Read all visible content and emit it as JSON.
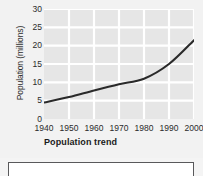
{
  "chart_data": {
    "type": "line",
    "title": "Population trend",
    "xlabel": "",
    "ylabel": "Population (millions)",
    "x": [
      1940,
      1950,
      1960,
      1970,
      1980,
      1990,
      2000
    ],
    "xtick_labels": [
      "1940",
      "1950",
      "1960",
      "1970",
      "1980",
      "1990",
      "2000"
    ],
    "ytick_labels": [
      "0",
      "5",
      "10",
      "15",
      "20",
      "25",
      "30"
    ],
    "yticks": [
      0,
      5,
      10,
      15,
      20,
      25,
      30
    ],
    "xlim": [
      1940,
      2000
    ],
    "ylim": [
      0,
      30
    ],
    "grid": true,
    "legend": "none",
    "series": [
      {
        "name": "Population",
        "values": [
          4.5,
          6.0,
          7.8,
          9.5,
          11.0,
          15.0,
          21.5
        ]
      }
    ],
    "line_color": "#2a2a2a",
    "plot_background": "#e6e6e6",
    "gridline_color": "#ffffff"
  },
  "figure": {
    "background": "#f2f2f2",
    "answer_box": {
      "label": "",
      "border_color": "#59595b",
      "fill": "#ffffff"
    }
  }
}
